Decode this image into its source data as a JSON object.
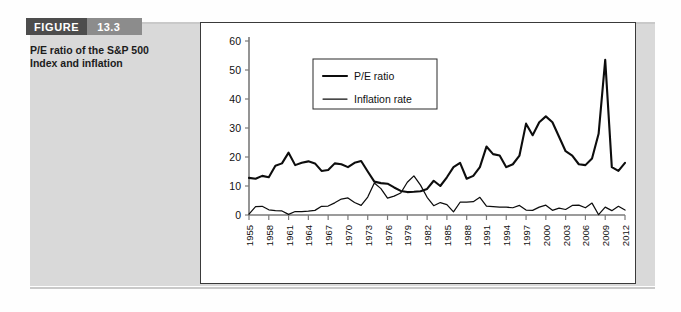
{
  "figure": {
    "label": "FIGURE",
    "number": "13.3",
    "caption": "P/E ratio of the S&P 500 Index and inflation",
    "caption_line1": "P/E ratio of the S&P 500",
    "caption_line2": "Index and inflation"
  },
  "colors": {
    "header_dark": "#4d4d4d",
    "header_light": "#8c8c8c",
    "panel_gray": "#d9d9d9",
    "line": "#0d0d0d",
    "axis": "#7a7a7a",
    "plot_border": "#3a3a3a"
  },
  "chart_data": {
    "type": "line",
    "title": "",
    "xlabel": "",
    "ylabel": "",
    "xlim": [
      1955,
      2012
    ],
    "ylim": [
      0,
      60
    ],
    "yticks": [
      0,
      10,
      20,
      30,
      40,
      50,
      60
    ],
    "ytick_labels": [
      "0",
      "10",
      "20",
      "30",
      "40",
      "50",
      "60"
    ],
    "xtick_labels": [
      "1955",
      "1958",
      "1961",
      "1964",
      "1967",
      "1970",
      "1973",
      "1976",
      "1979",
      "1982",
      "1985",
      "1988",
      "1991",
      "1994",
      "1997",
      "2000",
      "2003",
      "2006",
      "2009",
      "2012"
    ],
    "xtick_values": [
      1955,
      1958,
      1961,
      1964,
      1967,
      1970,
      1973,
      1976,
      1979,
      1982,
      1985,
      1988,
      1991,
      1994,
      1997,
      2000,
      2003,
      2006,
      2009,
      2012
    ],
    "grid": false,
    "legend_position": "upper-left-inside",
    "x": [
      1955,
      1956,
      1957,
      1958,
      1959,
      1960,
      1961,
      1962,
      1963,
      1964,
      1965,
      1966,
      1967,
      1968,
      1969,
      1970,
      1971,
      1972,
      1973,
      1974,
      1975,
      1976,
      1977,
      1978,
      1979,
      1980,
      1981,
      1982,
      1983,
      1984,
      1985,
      1986,
      1987,
      1988,
      1989,
      1990,
      1991,
      1992,
      1993,
      1994,
      1995,
      1996,
      1997,
      1998,
      1999,
      2000,
      2001,
      2002,
      2003,
      2004,
      2005,
      2006,
      2007,
      2008,
      2009,
      2010,
      2011,
      2012
    ],
    "series": [
      {
        "name": "P/E ratio",
        "style": "thick",
        "values": [
          12.8,
          12.5,
          13.5,
          13.0,
          17.0,
          17.8,
          21.5,
          17.2,
          18.0,
          18.5,
          17.8,
          15.2,
          15.5,
          17.8,
          17.5,
          16.5,
          18.0,
          18.6,
          15.0,
          11.5,
          11.0,
          10.8,
          9.5,
          8.3,
          7.9,
          8.0,
          8.2,
          9.0,
          11.8,
          10.0,
          13.0,
          16.5,
          18.0,
          12.5,
          13.5,
          16.5,
          23.6,
          21.0,
          20.5,
          16.5,
          17.5,
          20.5,
          31.5,
          27.5,
          32.0,
          34.0,
          32.0,
          27.0,
          22.0,
          20.5,
          17.5,
          17.2,
          19.5,
          28.0,
          53.5,
          16.5,
          15.2,
          18.0
        ]
      },
      {
        "name": "Inflation rate",
        "style": "thin",
        "values": [
          0.3,
          2.9,
          3.0,
          1.8,
          1.5,
          1.4,
          0.2,
          1.2,
          1.2,
          1.3,
          1.6,
          3.0,
          3.1,
          4.2,
          5.5,
          5.9,
          4.3,
          3.3,
          6.2,
          11.0,
          9.1,
          5.8,
          6.5,
          7.6,
          11.3,
          13.5,
          10.3,
          6.1,
          3.2,
          4.3,
          3.6,
          1.1,
          4.4,
          4.4,
          4.6,
          6.1,
          3.1,
          2.9,
          2.7,
          2.7,
          2.5,
          3.3,
          1.7,
          1.6,
          2.7,
          3.4,
          1.6,
          2.4,
          1.9,
          3.3,
          3.4,
          2.5,
          4.1,
          0.1,
          2.7,
          1.5,
          3.0,
          1.7
        ]
      }
    ]
  },
  "legend": {
    "items": [
      {
        "label": "P/E ratio",
        "style": "thick"
      },
      {
        "label": "Inflation rate",
        "style": "thin"
      }
    ]
  }
}
